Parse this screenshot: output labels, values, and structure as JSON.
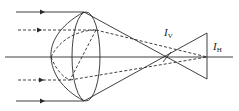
{
  "diagram": {
    "colors": {
      "line": "#2a2a2a",
      "background": "#ffffff"
    },
    "labels": {
      "vertical_focus": {
        "main": "I",
        "sub": "V"
      },
      "horizontal_focus": {
        "main": "I",
        "sub": "H"
      }
    },
    "rays": [
      {
        "id": "top-solid",
        "style": "solid",
        "y": 12
      },
      {
        "id": "upper-dashed",
        "style": "dashed",
        "y": 30
      },
      {
        "id": "lower-dashed",
        "style": "dashed",
        "y": 80
      },
      {
        "id": "bottom-solid",
        "style": "solid",
        "y": 101
      }
    ],
    "optical_axis": {
      "y": 57,
      "x_start": 5,
      "x_end": 233
    },
    "lens": {
      "vertex_top": [
        84,
        12
      ],
      "vertex_bottom": [
        84,
        101
      ]
    },
    "focus_points": {
      "I_V": [
        167,
        57
      ],
      "I_H": [
        207,
        57
      ]
    }
  }
}
